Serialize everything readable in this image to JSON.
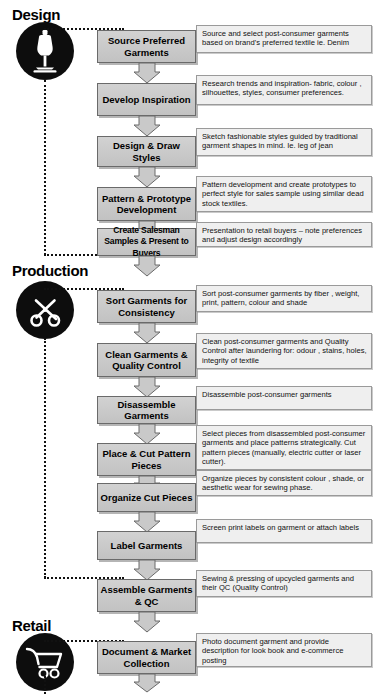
{
  "diagram": {
    "colors": {
      "process_fill": "#c9c9c9",
      "process_border": "#6a6a6a",
      "description_fill": "#efefef",
      "description_border": "#9a9a9a",
      "icon_circle": "#0d0d0d",
      "arrow_fill": "#c9c9c9",
      "text": "#000000"
    }
  },
  "sections": [
    {
      "id": "design",
      "label": "Design",
      "icon": "dress-form-mannequin-icon",
      "steps": [
        {
          "step": "Source Preferred Garments",
          "description": "Source and select post-consumer garments based on brand's preferred textile ie. Denim"
        },
        {
          "step": "Develop Inspiration",
          "description": "Research trends and inspiration- fabric, colour , silhouettes, styles, consumer preferences."
        },
        {
          "step": "Design & Draw Styles",
          "description": "Sketch fashionable styles guided by traditional garment shapes in mind. Ie. leg of jean"
        },
        {
          "step": "Pattern & Prototype Development",
          "description": "Pattern development and create prototypes to perfect style for sales sample using similar dead stock textiles."
        },
        {
          "step": "Create Salesman Samples & Present to Buyers",
          "description": "Presentation to retail buyers – note preferences and adjust design accordingly"
        }
      ]
    },
    {
      "id": "production",
      "label": "Production",
      "icon": "scissors-icon",
      "steps": [
        {
          "step": "Sort Garments for Consistency",
          "description": "Sort post-consumer garments by fiber , weight, print, pattern, colour and shade"
        },
        {
          "step": "Clean Garments & Quality Control",
          "description": "Clean post-consumer garments and Quality Control after laundering for: odour , stains, holes, integrity of textile"
        },
        {
          "step": "Disassemble Garments",
          "description": "Disassemble post-consumer garments"
        },
        {
          "step": "Place & Cut Pattern Pieces",
          "description": "Select pieces from disassembled post-consumer garments and place patterns strategically. Cut pattern pieces (manually, electric cutter or laser cutter)."
        },
        {
          "step": "Organize Cut Pieces",
          "description": "Organize pieces by consistent colour , shade, or aesthetic wear for sewing phase."
        },
        {
          "step": "Label Garments",
          "description": "Screen print labels on garment or attach labels"
        },
        {
          "step": "Assemble Garments & QC",
          "description": "Sewing & pressing of upcycled garments and their QC (Quality Control)"
        }
      ]
    },
    {
      "id": "retail",
      "label": "Retail",
      "icon": "shopping-cart-icon",
      "steps": [
        {
          "step": "Document & Market Collection",
          "description": "Photo document garment and provide description for look book and e-commerce posting"
        }
      ]
    }
  ]
}
